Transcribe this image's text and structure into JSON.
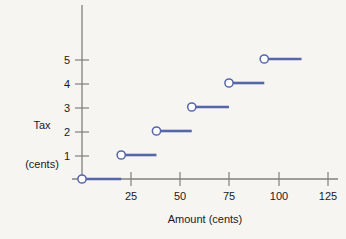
{
  "chart_data": {
    "type": "line",
    "title": "",
    "subtitle": "",
    "xlabel": "Amount (cents)",
    "ylabel_line1": "Tax",
    "ylabel_line2": "(cents)",
    "xlim": [
      0,
      130
    ],
    "ylim": [
      0,
      5.8
    ],
    "x_ticks": [
      25,
      50,
      75,
      100,
      125
    ],
    "x_tick_labels": [
      "25",
      "50",
      "75",
      "100",
      "125"
    ],
    "y_ticks": [
      1,
      2,
      3,
      4,
      5
    ],
    "y_tick_labels": [
      "1",
      "2",
      "3",
      "4",
      "5"
    ],
    "grid": false,
    "legend": "none",
    "series": [
      {
        "name": "Tax",
        "marker": "open-circle",
        "steps": [
          {
            "y": 0,
            "x_start": 0,
            "x_end": 20,
            "closed_left": true,
            "open_right": true
          },
          {
            "y": 1,
            "x_start": 20,
            "x_end": 38,
            "closed_left": true,
            "open_right": true
          },
          {
            "y": 2,
            "x_start": 38,
            "x_end": 56,
            "closed_left": true,
            "open_right": true
          },
          {
            "y": 3,
            "x_start": 56,
            "x_end": 75,
            "closed_left": true,
            "open_right": true
          },
          {
            "y": 4,
            "x_start": 75,
            "x_end": 93,
            "closed_left": true,
            "open_right": true
          },
          {
            "y": 5,
            "x_start": 93,
            "x_end": 112,
            "closed_left": true,
            "open_right": true
          }
        ]
      }
    ],
    "colors": {
      "series": "#5566aa",
      "marker_fill": "#ffffff",
      "axis": "#808080",
      "text": "#1a1a1a",
      "background": "#f7f5f2"
    }
  }
}
